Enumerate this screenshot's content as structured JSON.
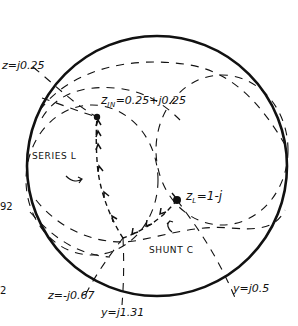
{
  "diagram": {
    "kind": "smith-chart-matching-sketch",
    "colors": {
      "ink": "#111111",
      "background": "#ffffff"
    },
    "labels": {
      "z_top": "z=j0.25",
      "z_in_prefix": "z",
      "z_in_sub": "IN",
      "z_in_value": "=0.25+j0.25",
      "series_l": "SERIES L",
      "z_load_prefix": "z",
      "z_load_sub": "L",
      "z_load_value": "=1-j",
      "shunt_c": "SHUNT C",
      "z_bottom": "z=-j0.67",
      "y_bottom": "y=j1.31",
      "y_right": "y=j0.5",
      "edge_left_1": "92",
      "edge_left_2": "2"
    },
    "points": [
      {
        "name": "z_in",
        "x": 97,
        "y": 117
      },
      {
        "name": "z_load",
        "x": 177,
        "y": 200
      },
      {
        "name": "intermediate",
        "x": 123,
        "y": 238
      }
    ]
  }
}
